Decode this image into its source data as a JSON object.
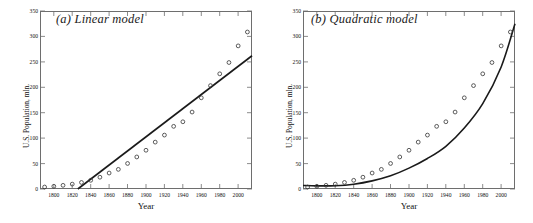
{
  "figure": {
    "panels": [
      {
        "id": "a",
        "title": "(a) Linear model",
        "xlabel": "Year",
        "ylabel": "U.S. Population, mln."
      },
      {
        "id": "b",
        "title": "(b) Quadratic model",
        "xlabel": "Year",
        "ylabel": "U.S. Population, mln."
      }
    ]
  },
  "chart_data": [
    {
      "type": "scatter",
      "title": "(a) Linear model",
      "xlabel": "Year",
      "ylabel": "U.S. Population, mln.",
      "xlim": [
        1785,
        2015
      ],
      "ylim": [
        0,
        350
      ],
      "xticks": [
        1800,
        1820,
        1840,
        1860,
        1880,
        1900,
        1920,
        1940,
        1960,
        1980,
        2000
      ],
      "yticks": [
        0,
        50,
        100,
        150,
        200,
        250,
        300,
        350
      ],
      "grid": false,
      "legend": "none",
      "series": [
        {
          "name": "U.S. Census population",
          "marker": "open-circle",
          "color": "#333333",
          "x": [
            1790,
            1800,
            1810,
            1820,
            1830,
            1840,
            1850,
            1860,
            1870,
            1880,
            1890,
            1900,
            1910,
            1920,
            1930,
            1940,
            1950,
            1960,
            1970,
            1980,
            1990,
            2000,
            2010
          ],
          "y": [
            3.9,
            5.3,
            7.2,
            9.6,
            12.9,
            17.1,
            23.2,
            31.4,
            38.6,
            50.2,
            63.0,
            76.2,
            92.2,
            106.0,
            123.2,
            132.2,
            151.3,
            179.3,
            203.3,
            226.5,
            248.7,
            281.4,
            308.7
          ]
        },
        {
          "name": "Linear fit",
          "marker": "line",
          "color": "#1a1a1a",
          "x": [
            1826,
            2015
          ],
          "y": [
            0,
            262
          ]
        }
      ]
    },
    {
      "type": "scatter",
      "title": "(b) Quadratic model",
      "xlabel": "Year",
      "ylabel": "U.S. Population, mln.",
      "xlim": [
        1785,
        2015
      ],
      "ylim": [
        0,
        350
      ],
      "xticks": [
        1800,
        1820,
        1840,
        1860,
        1880,
        1900,
        1920,
        1940,
        1960,
        1980,
        2000
      ],
      "yticks": [
        0,
        50,
        100,
        150,
        200,
        250,
        300,
        350
      ],
      "grid": false,
      "legend": "none",
      "series": [
        {
          "name": "U.S. Census population",
          "marker": "open-circle",
          "color": "#333333",
          "x": [
            1790,
            1800,
            1810,
            1820,
            1830,
            1840,
            1850,
            1860,
            1870,
            1880,
            1890,
            1900,
            1910,
            1920,
            1930,
            1940,
            1950,
            1960,
            1970,
            1980,
            1990,
            2000,
            2010
          ],
          "y": [
            3.9,
            5.3,
            7.2,
            9.6,
            12.9,
            17.1,
            23.2,
            31.4,
            38.6,
            50.2,
            63.0,
            76.2,
            92.2,
            106.0,
            123.2,
            132.2,
            151.3,
            179.3,
            203.3,
            226.5,
            248.7,
            281.4,
            308.7
          ]
        },
        {
          "name": "Quadratic fit",
          "marker": "curve",
          "color": "#1a1a1a",
          "x": [
            1785,
            1800,
            1820,
            1840,
            1860,
            1880,
            1900,
            1920,
            1940,
            1960,
            1980,
            2000,
            2015
          ],
          "y": [
            7.0,
            6.2,
            6.5,
            9.5,
            16.0,
            26.0,
            41.0,
            60.0,
            84.0,
            120.0,
            168.0,
            240.0,
            325.0
          ]
        }
      ]
    }
  ]
}
